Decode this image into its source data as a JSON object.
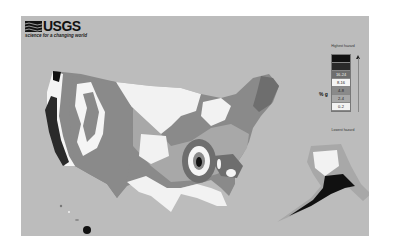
{
  "header": {
    "logo_text": "USGS",
    "tagline": "science for a changing world"
  },
  "map": {
    "title": "Seismic Hazard Map of the United States",
    "regions": [
      "Conterminous United States",
      "Alaska",
      "Hawaii"
    ],
    "background_color": "#bcbcbc"
  },
  "legend": {
    "top_label": "Highest hazard",
    "bottom_label": "Lowest hazard",
    "units": "% g",
    "bins": [
      {
        "label": "",
        "color": "#111111"
      },
      {
        "label": "",
        "color": "#2a2a2a"
      },
      {
        "label": "16-24",
        "color": "#6e6e6e"
      },
      {
        "label": "8-16",
        "color": "#f5f5f5"
      },
      {
        "label": "4-8",
        "color": "#8a8a8a"
      },
      {
        "label": "2-4",
        "color": "#a8a8a8"
      },
      {
        "label": "0-2",
        "color": "#f2f2f2"
      }
    ]
  }
}
